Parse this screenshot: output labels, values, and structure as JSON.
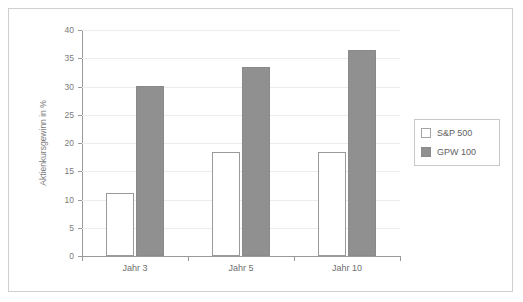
{
  "chart_data": {
    "type": "bar",
    "title": "",
    "subtitle": "",
    "xlabel": "",
    "ylabel": "Aktienkursgewinn in %",
    "categories": [
      "Jahr 3",
      "Jahr 5",
      "Jahr 10"
    ],
    "series": [
      {
        "name": "S&P 500",
        "color": "#ffffff",
        "values": [
          11.1,
          18.4,
          18.4
        ]
      },
      {
        "name": "GPW 100",
        "color": "#909090",
        "values": [
          30.0,
          33.4,
          36.5
        ]
      }
    ],
    "ylim": [
      0,
      40
    ],
    "ytick_values": [
      0,
      5,
      10,
      15,
      20,
      25,
      30,
      35,
      40
    ],
    "ytick_labels": [
      "0",
      "5",
      "10",
      "15",
      "20",
      "25",
      "30",
      "35",
      "40"
    ],
    "grid": true,
    "legend_position": "right"
  },
  "legend": {
    "entries": [
      {
        "label": "S&P 500",
        "swatch": "white-square-swatch"
      },
      {
        "label": "GPW 100",
        "swatch": "gray-square-swatch"
      }
    ]
  },
  "colors": {
    "series_light": "#ffffff",
    "series_dark": "#909090",
    "grid": "#ececec",
    "axis": "#9a9a9a",
    "frame": "#cfcfcf",
    "text": "#6e6e6e",
    "background": "#ffffff"
  }
}
